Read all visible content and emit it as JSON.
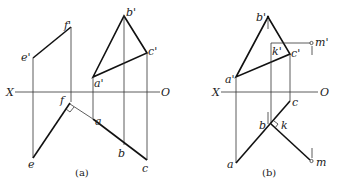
{
  "figure_a": {
    "caption": "(a)",
    "axis": {
      "left_label": "X",
      "right_label": "O"
    },
    "points": {
      "e_prime": "e'",
      "f_prime": "f'",
      "e": "e",
      "f": "f",
      "a_prime": "a'",
      "b_prime": "b'",
      "c_prime": "c'",
      "a": "a",
      "b": "b",
      "c": "c"
    }
  },
  "figure_b": {
    "caption": "(b)",
    "axis": {
      "left_label": "X",
      "right_label": "O"
    },
    "points": {
      "a_prime": "a'",
      "b_prime": "b'",
      "c_prime": "c'",
      "k_prime": "k'",
      "m_prime": "m'",
      "a": "a",
      "b": "b",
      "c": "c",
      "k": "k",
      "m": "m"
    }
  }
}
